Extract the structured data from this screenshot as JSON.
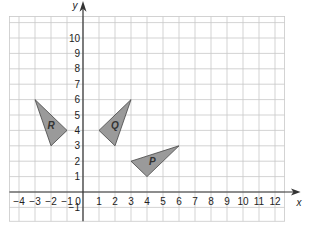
{
  "diagram": {
    "type": "coordinate-grid",
    "axes": {
      "x_label": "x",
      "y_label": "y",
      "x_ticks": [
        "-4",
        "-3",
        "-2",
        "-1",
        "0",
        "1",
        "2",
        "3",
        "4",
        "5",
        "6",
        "7",
        "8",
        "9",
        "10",
        "11",
        "12"
      ],
      "y_ticks": [
        "-1",
        "1",
        "2",
        "3",
        "4",
        "5",
        "6",
        "7",
        "8",
        "9",
        "10"
      ],
      "x_range": [
        -4,
        12
      ],
      "y_range": [
        -1,
        10
      ]
    },
    "shapes": [
      {
        "label": "R",
        "vertices": [
          [
            -3,
            6
          ],
          [
            -1,
            4
          ],
          [
            -2,
            3
          ]
        ],
        "fill": "#9a9a9a"
      },
      {
        "label": "Q",
        "vertices": [
          [
            3,
            6
          ],
          [
            1,
            4
          ],
          [
            2,
            3
          ]
        ],
        "fill": "#9a9a9a"
      },
      {
        "label": "P",
        "vertices": [
          [
            3,
            2
          ],
          [
            6,
            3
          ],
          [
            4,
            1
          ]
        ],
        "fill": "#9a9a9a"
      }
    ],
    "colors": {
      "grid": "#c8c8c8",
      "axis": "#333333",
      "shape_stroke": "#444444"
    }
  }
}
